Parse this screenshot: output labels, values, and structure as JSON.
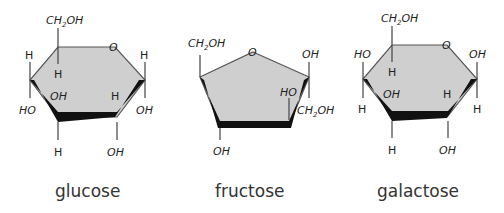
{
  "molecules": [
    {
      "name": "glucose",
      "ring": "hexagon",
      "labels": {
        "top": "CH",
        "top_sub": "2",
        "top_tail": "OH",
        "ring_o": "O",
        "c4_up": "H",
        "c4_down": "HO",
        "c5_inner_down": "H",
        "c3_up": "OH",
        "c3_down": "H",
        "c2_up": "H",
        "c2_down": "OH",
        "c1_up": "H",
        "c1_down": "OH"
      }
    },
    {
      "name": "fructose",
      "ring": "pentagon",
      "labels": {
        "left_top": "CH",
        "left_top_sub": "2",
        "left_top_tail": "OH",
        "ring_o": "O",
        "right_top": "OH",
        "right_down": "CH",
        "right_down_sub": "2",
        "right_down_tail": "OH",
        "c3_up": "HO",
        "c4_down": "OH"
      }
    },
    {
      "name": "galactose",
      "ring": "hexagon",
      "labels": {
        "top": "CH",
        "top_sub": "2",
        "top_tail": "OH",
        "ring_o": "O",
        "c4_up": "HO",
        "c4_down": "H",
        "c5_inner_down": "H",
        "c3_up": "OH",
        "c3_down": "H",
        "c2_up": "H",
        "c2_down": "OH",
        "c1_up": "OH",
        "c1_down": "H"
      }
    }
  ]
}
